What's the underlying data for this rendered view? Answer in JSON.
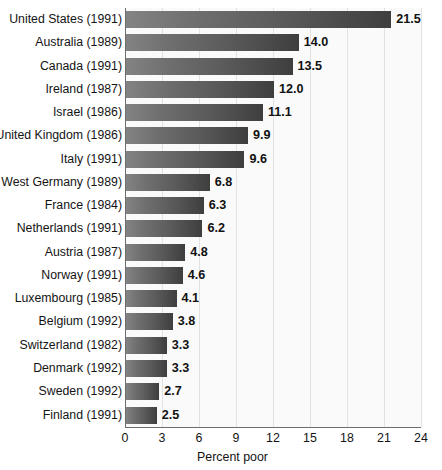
{
  "chart_data": {
    "type": "bar",
    "orientation": "horizontal",
    "title": "",
    "xlabel": "Percent poor",
    "ylabel": "",
    "xlim": [
      0,
      24
    ],
    "xticks": [
      0,
      3,
      6,
      9,
      12,
      15,
      18,
      21,
      24
    ],
    "grid": "vertical",
    "legend": "none",
    "value_label_format": "one-decimal",
    "categories": [
      "United States (1991)",
      "Australia (1989)",
      "Canada (1991)",
      "Ireland (1987)",
      "Israel (1986)",
      "United Kingdom (1986)",
      "Italy (1991)",
      "West Germany (1989)",
      "France (1984)",
      "Netherlands (1991)",
      "Austria (1987)",
      "Norway (1991)",
      "Luxembourg (1985)",
      "Belgium (1992)",
      "Switzerland (1982)",
      "Denmark (1992)",
      "Sweden (1992)",
      "Finland (1991)"
    ],
    "values": [
      21.5,
      14.0,
      13.5,
      12.0,
      11.1,
      9.9,
      9.6,
      6.8,
      6.3,
      6.2,
      4.8,
      4.6,
      4.1,
      3.8,
      3.3,
      3.3,
      2.7,
      2.5
    ],
    "value_labels": [
      "21.5",
      "14.0",
      "13.5",
      "12.0",
      "11.1",
      "9.9",
      "9.6",
      "6.8",
      "6.3",
      "6.2",
      "4.8",
      "4.6",
      "4.1",
      "3.8",
      "3.3",
      "3.3",
      "2.7",
      "2.5"
    ],
    "colors": {
      "bar_light": "#838383",
      "bar_dark": "#3e3e3e",
      "plot_background": "#fafafa",
      "gridline": "#e2e2e2",
      "axis": "#6d6d6d",
      "text": "#141414"
    }
  }
}
